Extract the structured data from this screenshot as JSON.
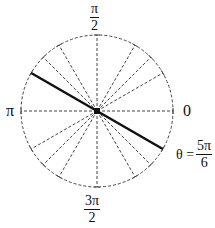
{
  "diagram": {
    "center": [
      97,
      111
    ],
    "radius": 76,
    "labels": {
      "top": {
        "num": "π",
        "den": "2"
      },
      "left": "π",
      "right": "0",
      "bottom": {
        "num": "3π",
        "den": "2"
      },
      "theta": {
        "prefix": "θ =",
        "num": "5π",
        "den": "6"
      }
    },
    "dashed_rays_degrees": [
      0,
      30,
      45,
      60,
      90,
      120,
      135,
      150,
      180,
      210,
      225,
      240,
      270,
      300,
      315,
      330
    ],
    "highlighted_line_degrees": 150,
    "colors": {
      "line": "#111111",
      "dashed": "#444444",
      "background": "#ffffff"
    }
  }
}
